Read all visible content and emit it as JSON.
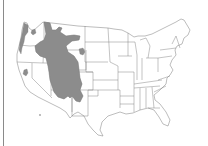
{
  "map": {
    "title": "",
    "description": "Contiguous United States outline map with a shaded distribution range",
    "base": "contiguous-us-state-outlines",
    "colors": {
      "background": "#ffffff",
      "state_outline": "#7a7a7a",
      "range_fill": "#8c8c8c",
      "left_border": "#8a8a8a"
    },
    "shaded_regions": [
      {
        "name": "main-range",
        "area": "Rocky Mountains and Great Basin (MT, ID, WY, UT, CO, NM, AZ, NV east)"
      },
      {
        "name": "pacific-northwest-patch",
        "area": "Western Washington / Oregon coast"
      },
      {
        "name": "northern-idaho-patch",
        "area": "Northeast Washington / north Idaho"
      },
      {
        "name": "sierra-patch",
        "area": "Central California (Sierra Nevada)"
      },
      {
        "name": "black-hills-patch",
        "area": "Western South Dakota (Black Hills)"
      }
    ],
    "outlier_points": [
      {
        "name": "southern-california-point",
        "area": "Southern California"
      }
    ]
  }
}
